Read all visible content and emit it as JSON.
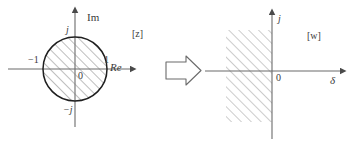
{
  "figure": {
    "title_z_plane": "[z]",
    "title_w_plane": "[w]",
    "transform_arrow": "block-arrow-right"
  },
  "z_plane": {
    "axis_vertical_label": "Im",
    "axis_horizontal_label": "Re",
    "origin_label": "0",
    "tick_left_label": "−1",
    "tick_right_label": "1",
    "tick_top_label": "j",
    "tick_bottom_label": "−j",
    "region_description": "hatched unit disk",
    "unit_circle_radius": 1
  },
  "w_plane": {
    "axis_vertical_label": "j",
    "axis_horizontal_label": "δ",
    "origin_label": "0",
    "region_description": "hatched left half-plane"
  },
  "colors": {
    "stroke": "#5a5a5a",
    "circle_stroke": "#1a1a1a",
    "hatch": "#8a8a8a",
    "text": "#3a3a3a",
    "background": "#ffffff"
  }
}
